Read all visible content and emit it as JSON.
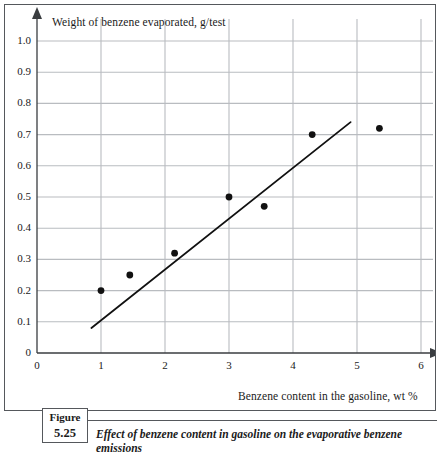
{
  "figure": {
    "tag_label": "Figure",
    "tag_number": "5.25",
    "caption": "Effect of benzene content in gasoline on the evaporative benzene emissions"
  },
  "colors": {
    "gridline": "#b9bcc0",
    "axis": "#3a3d40",
    "marker": "#111111",
    "trendline": "#111111",
    "frame": "#55585c"
  },
  "chart_data": {
    "type": "scatter",
    "title": "",
    "xlabel": "Benzene content in the gasoline, wt %",
    "ylabel": "Weight of benzene evaporated, g/test",
    "xlim": [
      0,
      6
    ],
    "ylim": [
      0,
      1.0
    ],
    "xticks": [
      0,
      1,
      2,
      3,
      4,
      5,
      6
    ],
    "xtick_labels": [
      "0",
      "1",
      "2",
      "3",
      "4",
      "5",
      "6"
    ],
    "yticks": [
      0,
      0.1,
      0.2,
      0.3,
      0.4,
      0.5,
      0.6,
      0.7,
      0.8,
      0.9,
      1.0
    ],
    "ytick_labels": [
      "0",
      "0.1",
      "0.2",
      "0.3",
      "0.4",
      "0.5",
      "0.6",
      "0.7",
      "0.8",
      "0.9",
      "1.0"
    ],
    "grid": true,
    "legend": false,
    "y_origin_label": "0",
    "series": [
      {
        "name": "Measured benzene emissions",
        "type": "scatter",
        "points": [
          {
            "x": 1.0,
            "y": 0.2
          },
          {
            "x": 1.45,
            "y": 0.25
          },
          {
            "x": 2.15,
            "y": 0.32
          },
          {
            "x": 3.0,
            "y": 0.5
          },
          {
            "x": 3.55,
            "y": 0.47
          },
          {
            "x": 4.3,
            "y": 0.7
          },
          {
            "x": 5.35,
            "y": 0.72
          }
        ]
      },
      {
        "name": "Fitted trend line",
        "type": "line",
        "points": [
          {
            "x": 0.85,
            "y": 0.08
          },
          {
            "x": 4.9,
            "y": 0.74
          }
        ]
      }
    ]
  }
}
